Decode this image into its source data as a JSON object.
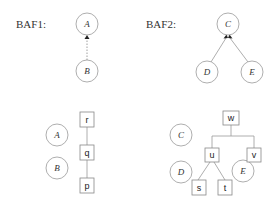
{
  "panels": {
    "baf1": {
      "label": "BAF1:",
      "arguments": [
        {
          "id": "A",
          "label": "A"
        },
        {
          "id": "B",
          "label": "B"
        }
      ],
      "supports": [
        {
          "from": "B",
          "to": "A"
        }
      ]
    },
    "baf2": {
      "label": "BAF2:",
      "arguments": [
        {
          "id": "C",
          "label": "C"
        },
        {
          "id": "D",
          "label": "D"
        },
        {
          "id": "E",
          "label": "E"
        }
      ],
      "supports": [
        {
          "from": "D",
          "to": "C"
        },
        {
          "from": "E",
          "to": "C"
        }
      ]
    },
    "tree1": {
      "arguments": [
        {
          "label": "A"
        },
        {
          "label": "B"
        }
      ],
      "nodes": [
        {
          "label": "r"
        },
        {
          "label": "q"
        },
        {
          "label": "p"
        }
      ]
    },
    "tree2": {
      "arguments": [
        {
          "label": "C"
        },
        {
          "label": "D"
        },
        {
          "label": "E"
        }
      ],
      "nodes": [
        {
          "label": "w"
        },
        {
          "label": "u"
        },
        {
          "label": "v"
        },
        {
          "label": "s"
        },
        {
          "label": "t"
        }
      ]
    }
  }
}
